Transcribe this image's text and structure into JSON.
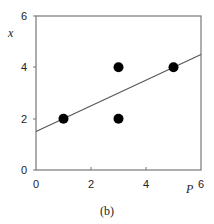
{
  "chart_data": {
    "type": "scatter",
    "title": "",
    "caption": "(b)",
    "xlabel": "P",
    "ylabel": "x",
    "xlim": [
      0,
      6
    ],
    "ylim": [
      0,
      6
    ],
    "xticks": [
      "0",
      "2",
      "4",
      "6"
    ],
    "yticks": [
      "0",
      "2",
      "4",
      "6"
    ],
    "grid": false,
    "legend": null,
    "series": [
      {
        "name": "points",
        "type": "scatter",
        "x": [
          1,
          3,
          3,
          5
        ],
        "y": [
          2,
          4,
          2,
          4
        ]
      },
      {
        "name": "fit line",
        "type": "line",
        "x": [
          0,
          6
        ],
        "y": [
          1.5,
          4.5
        ]
      }
    ]
  }
}
